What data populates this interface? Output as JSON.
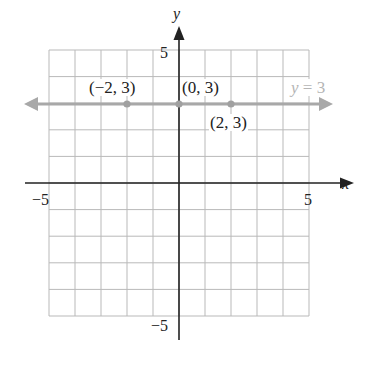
{
  "chart_data": {
    "type": "line",
    "title": "",
    "xlabel": "x",
    "ylabel": "y",
    "xlim": [
      -5,
      5
    ],
    "ylim": [
      -5,
      5
    ],
    "grid": true,
    "grid_step": 1,
    "x_tick_labels": [
      "-5",
      "5"
    ],
    "y_tick_labels": [
      "5",
      "-5"
    ],
    "series": [
      {
        "name": "y = 3",
        "kind": "horizontal line",
        "equation": "y = 3",
        "color": "#a8a8a8",
        "arrows": "both ends",
        "y": 3
      }
    ],
    "points": [
      {
        "x": -2,
        "y": 3,
        "label": "(−2, 3)"
      },
      {
        "x": 0,
        "y": 3,
        "label": "(0, 3)"
      },
      {
        "x": 2,
        "y": 3,
        "label": "(2, 3)"
      }
    ],
    "annotations": [
      "y = 3"
    ]
  },
  "labels": {
    "x_axis": "x",
    "y_axis": "y",
    "x_min": "−5",
    "x_max": "5",
    "y_max": "5",
    "y_min": "−5",
    "pt_neg2": "(−2, 3)",
    "pt_0": "(0, 3)",
    "pt_2": "(2, 3)",
    "eq_var": "y",
    "eq_rest": " = 3"
  },
  "colors": {
    "grid": "#b9b9b9",
    "axis": "#222222",
    "line": "#a8a8a8",
    "point": "#a0a0a0"
  }
}
